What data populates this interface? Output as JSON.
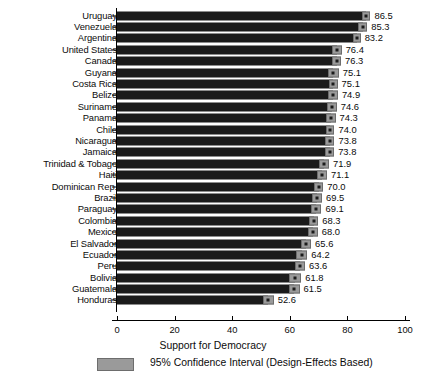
{
  "chart_data": {
    "type": "bar",
    "title": "",
    "xlabel": "Support for Democracy",
    "ylabel": "",
    "xlim": [
      0,
      105
    ],
    "xticks": [
      0,
      20,
      40,
      60,
      80,
      100
    ],
    "grid": false,
    "orientation": "horizontal",
    "legend": {
      "position": "bottom-left",
      "entries": [
        {
          "label": "95% Confidence Interval (Design-Effects Based)",
          "color": "#9a9a9a"
        }
      ]
    },
    "categories": [
      "Uruguay",
      "Venezuela",
      "Argentina",
      "United States",
      "Canada",
      "Guyana",
      "Costa Rica",
      "Belize",
      "Suriname",
      "Panama",
      "Chile",
      "Nicaragua",
      "Jamaica",
      "Trinidad & Tobago",
      "Haiti",
      "Dominican Rep.",
      "Brazil",
      "Paraguay",
      "Colombia",
      "Mexico",
      "El Salvador",
      "Ecuador",
      "Peru",
      "Bolivia",
      "Guatemala",
      "Honduras"
    ],
    "values": [
      86.5,
      85.3,
      83.2,
      76.4,
      76.3,
      75.1,
      75.1,
      74.9,
      74.6,
      74.3,
      74.0,
      73.8,
      73.8,
      71.9,
      71.1,
      70.0,
      69.5,
      69.1,
      68.3,
      68.0,
      65.6,
      64.2,
      63.6,
      61.8,
      61.5,
      52.6
    ],
    "value_labels": [
      "86.5",
      "85.3",
      "83.2",
      "76.4",
      "76.3",
      "75.1",
      "75.1",
      "74.9",
      "74.6",
      "74.3",
      "74.0",
      "73.8",
      "73.8",
      "71.9",
      "71.1",
      "70.0",
      "69.5",
      "69.1",
      "68.3",
      "68.0",
      "65.6",
      "64.2",
      "63.6",
      "61.8",
      "61.5",
      "52.6"
    ],
    "ci_half_width": [
      1.5,
      1.6,
      1.4,
      1.6,
      1.5,
      1.9,
      1.5,
      1.8,
      1.7,
      1.6,
      1.5,
      1.7,
      1.6,
      1.7,
      1.8,
      1.6,
      1.7,
      1.9,
      1.6,
      1.7,
      1.8,
      1.9,
      1.7,
      2.2,
      1.9,
      1.8
    ],
    "bar_color": "#1b1b1b",
    "ci_color": "#9a9a9a"
  }
}
